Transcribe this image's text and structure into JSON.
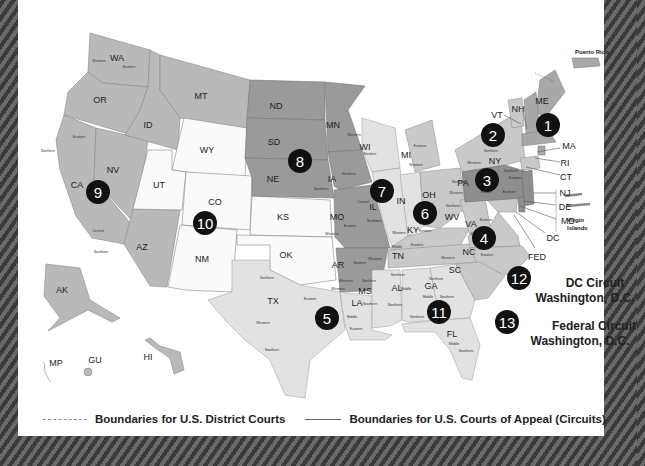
{
  "map": {
    "title": "U.S. Federal Court Circuits",
    "legend": {
      "district": "Boundaries for U.S. District Courts",
      "circuit": "Boundaries for U.S. Courts of Appeal (Circuits)"
    },
    "territories": {
      "puerto_rico": "Puerto Rico",
      "virgin_islands_1": "Virgin",
      "virgin_islands_2": "Islands"
    },
    "circuits": [
      {
        "number": "1",
        "states": [
          "ME",
          "NH",
          "MA",
          "RI"
        ]
      },
      {
        "number": "2",
        "states": [
          "VT",
          "NY",
          "CT"
        ]
      },
      {
        "number": "3",
        "states": [
          "PA",
          "NJ",
          "DE"
        ]
      },
      {
        "number": "4",
        "states": [
          "MD",
          "VA",
          "WV",
          "NC",
          "SC"
        ]
      },
      {
        "number": "5",
        "states": [
          "TX",
          "LA",
          "MS"
        ]
      },
      {
        "number": "6",
        "states": [
          "OH",
          "MI",
          "KY",
          "TN"
        ]
      },
      {
        "number": "7",
        "states": [
          "WI",
          "IL",
          "IN"
        ]
      },
      {
        "number": "8",
        "states": [
          "ND",
          "SD",
          "NE",
          "MN",
          "IA",
          "MO",
          "AR"
        ]
      },
      {
        "number": "9",
        "states": [
          "WA",
          "OR",
          "CA",
          "NV",
          "ID",
          "MT",
          "AZ",
          "AK",
          "HI",
          "GU",
          "MP"
        ]
      },
      {
        "number": "10",
        "states": [
          "WY",
          "UT",
          "CO",
          "KS",
          "NM",
          "OK"
        ]
      },
      {
        "number": "11",
        "states": [
          "GA",
          "AL",
          "FL"
        ]
      },
      {
        "number": "12",
        "name": "DC Circuit",
        "location": "Washington, D.C."
      },
      {
        "number": "13",
        "name": "Federal Circuit",
        "location": "Washington, D.C."
      }
    ],
    "labels": {
      "WA": "WA",
      "OR": "OR",
      "CA": "CA",
      "NV": "NV",
      "ID": "ID",
      "MT": "MT",
      "AZ": "AZ",
      "WY": "WY",
      "UT": "UT",
      "CO": "CO",
      "NM": "NM",
      "KS": "KS",
      "OK": "OK",
      "TX": "TX",
      "ND": "ND",
      "SD": "SD",
      "NE": "NE",
      "MN": "MN",
      "IA": "IA",
      "MO": "MO",
      "AR": "AR",
      "WI": "WI",
      "IL": "IL",
      "IN": "IN",
      "MI": "MI",
      "OH": "OH",
      "KY": "KY",
      "TN": "TN",
      "LA": "LA",
      "MS": "MS",
      "AL": "AL",
      "GA": "GA",
      "FL": "FL",
      "SC": "SC",
      "NC": "NC",
      "VA": "VA",
      "WV": "WV",
      "PA": "PA",
      "NY": "NY",
      "VT": "VT",
      "NH": "NH",
      "ME": "ME",
      "MA": "MA",
      "RI": "RI",
      "CT": "CT",
      "NJ": "NJ",
      "DE": "DE",
      "MD": "MD",
      "DC": "DC",
      "FED": "FED",
      "AK": "AK",
      "HI": "HI",
      "GU": "GU",
      "MP": "MP"
    },
    "districts": {
      "western": "Western",
      "eastern": "Eastern",
      "northern": "Northern",
      "southern": "Southern",
      "central": "Central",
      "middle": "Middle"
    }
  }
}
